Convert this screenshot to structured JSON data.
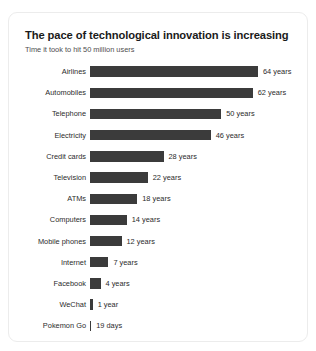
{
  "card": {
    "background_color": "#ffffff",
    "border_color": "#ececec"
  },
  "chart_data": {
    "type": "bar",
    "orientation": "horizontal",
    "title": "The pace of technological innovation is increasing",
    "subtitle": "Time it took to hit 50 million users",
    "xlabel": "",
    "ylabel": "",
    "grid": false,
    "legend": false,
    "bar_color": "#3b3b3b",
    "categories": [
      "Airlines",
      "Automobiles",
      "Telephone",
      "Electricity",
      "Credit cards",
      "Television",
      "ATMs",
      "Computers",
      "Mobile phones",
      "Internet",
      "Facebook",
      "WeChat",
      "Pokemon Go"
    ],
    "values": [
      64,
      62,
      50,
      46,
      28,
      22,
      18,
      14,
      12,
      7,
      4,
      1,
      0.052
    ],
    "unit": "years",
    "value_labels": [
      "64 years",
      "62 years",
      "50 years",
      "46 years",
      "28 years",
      "22 years",
      "18 years",
      "14 years",
      "12 years",
      "7 years",
      "4 years",
      "1 year",
      "19 days"
    ],
    "xlim": [
      0,
      64
    ]
  }
}
